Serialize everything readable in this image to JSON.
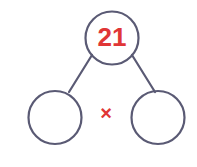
{
  "canvas": {
    "width": 197,
    "height": 167,
    "background_color": "#ffffff"
  },
  "style": {
    "stroke_color": "#5a5a74",
    "stroke_width": 2.2,
    "accent_color": "#e03636",
    "value_font_size": 26,
    "operator_font_size": 20
  },
  "diagram": {
    "kind": "number-bond-factor-tree",
    "parent": {
      "label": "21",
      "cx": 112,
      "cy": 38,
      "r": 26.5,
      "text_color": "#e03636",
      "filled": false
    },
    "children": [
      {
        "label": "",
        "cx": 55,
        "cy": 117.5,
        "r": 26.5,
        "text_color": "#e03636",
        "filled": false
      },
      {
        "label": "",
        "cx": 158,
        "cy": 117.5,
        "r": 26.5,
        "text_color": "#e03636",
        "filled": false
      }
    ],
    "branches": [
      {
        "x1": 92,
        "y1": 55,
        "x2": 69,
        "y2": 92
      },
      {
        "x1": 132,
        "y1": 55,
        "x2": 155,
        "y2": 92
      }
    ],
    "operator": {
      "symbol": "×",
      "cx": 106,
      "cy": 114,
      "color": "#e03636"
    }
  }
}
